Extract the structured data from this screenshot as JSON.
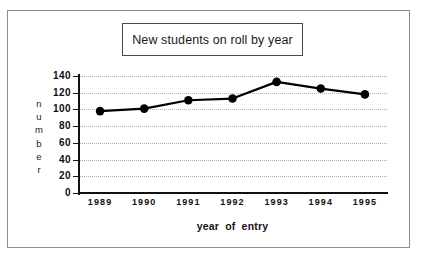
{
  "chart_data": {
    "type": "line",
    "title": "New students on roll by year",
    "xlabel": "year of entry",
    "ylabel": "number",
    "categories": [
      "1989",
      "1990",
      "1991",
      "1992",
      "1993",
      "1994",
      "1995"
    ],
    "values": [
      98,
      101,
      111,
      113,
      133,
      125,
      118
    ],
    "series": [
      {
        "name": "New students on roll",
        "values": [
          98,
          101,
          111,
          113,
          133,
          125,
          118
        ]
      }
    ],
    "ylim": [
      0,
      140
    ],
    "yticks": [
      "140",
      "120",
      "100",
      "80",
      "60",
      "40",
      "20",
      "0"
    ],
    "ytick_values": [
      140,
      120,
      100,
      80,
      60,
      40,
      20,
      0
    ],
    "grid": true,
    "grid_axis": "y",
    "legend": false,
    "legend_position": "none",
    "marker": "filled-circle",
    "line_color": "#000000",
    "marker_color": "#000000",
    "grid_color": "#b2b2b2",
    "axis_color": "#111111",
    "background_color": "#ffffff"
  },
  "figure": {
    "frame_border_color": "#8d8d8d",
    "title_box_border_color": "#4a4a4a",
    "ylabel_letters": [
      "n",
      "u",
      "m",
      "b",
      "e",
      "r"
    ]
  }
}
